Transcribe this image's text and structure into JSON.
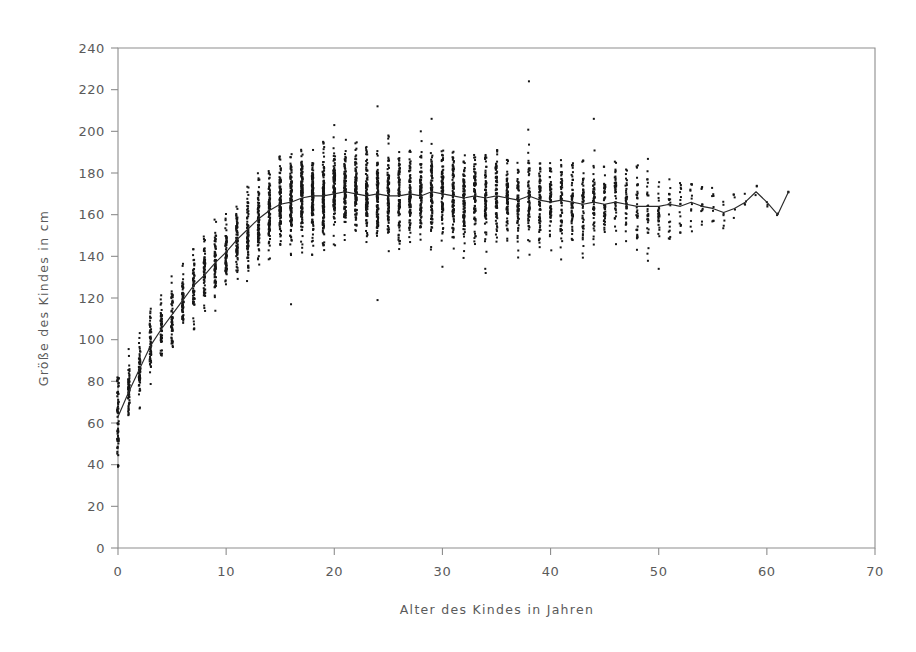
{
  "chart_data": {
    "type": "scatter",
    "title": "",
    "subtitle": "",
    "xlabel": "Alter des Kindes in Jahren",
    "ylabel": "Größe des Kindes in cm",
    "xlim": [
      0,
      70
    ],
    "ylim": [
      0,
      240
    ],
    "xticks": [
      0,
      10,
      20,
      30,
      40,
      50,
      60,
      70
    ],
    "yticks": [
      0,
      20,
      40,
      60,
      80,
      100,
      120,
      140,
      160,
      180,
      200,
      220,
      240
    ],
    "grid": false,
    "legend": null,
    "legend_position": "none",
    "point_color": "#161616",
    "line_color": "#2a2a2a",
    "axis_color": "#8d8d8d",
    "marker_size": 2,
    "series": [
      {
        "name": "Beobachtungen",
        "type": "scatter",
        "columns": [
          {
            "x": 0,
            "n": 70,
            "median": 63,
            "q_low": 52,
            "q_high": 78,
            "min": 39,
            "max": 82
          },
          {
            "x": 1,
            "n": 62,
            "median": 75,
            "q_low": 68,
            "q_high": 84,
            "min": 63,
            "max": 101
          },
          {
            "x": 2,
            "n": 60,
            "median": 86,
            "q_low": 79,
            "q_high": 95,
            "min": 67,
            "max": 104
          },
          {
            "x": 3,
            "n": 58,
            "median": 97,
            "q_low": 89,
            "q_high": 106,
            "min": 78,
            "max": 115
          },
          {
            "x": 4,
            "n": 56,
            "median": 105,
            "q_low": 97,
            "q_high": 113,
            "min": 85,
            "max": 122
          },
          {
            "x": 5,
            "n": 58,
            "median": 112,
            "q_low": 104,
            "q_high": 120,
            "min": 92,
            "max": 132
          },
          {
            "x": 6,
            "n": 60,
            "median": 119,
            "q_low": 111,
            "q_high": 128,
            "min": 99,
            "max": 141
          },
          {
            "x": 7,
            "n": 62,
            "median": 126,
            "q_low": 117,
            "q_high": 134,
            "min": 104,
            "max": 146
          },
          {
            "x": 8,
            "n": 66,
            "median": 131,
            "q_low": 122,
            "q_high": 140,
            "min": 108,
            "max": 152
          },
          {
            "x": 9,
            "n": 70,
            "median": 137,
            "q_low": 128,
            "q_high": 146,
            "min": 113,
            "max": 158
          },
          {
            "x": 10,
            "n": 74,
            "median": 142,
            "q_low": 132,
            "q_high": 152,
            "min": 117,
            "max": 164
          },
          {
            "x": 11,
            "n": 78,
            "median": 148,
            "q_low": 138,
            "q_high": 158,
            "min": 122,
            "max": 171
          },
          {
            "x": 12,
            "n": 84,
            "median": 153,
            "q_low": 142,
            "q_high": 164,
            "min": 127,
            "max": 175
          },
          {
            "x": 13,
            "n": 92,
            "median": 158,
            "q_low": 147,
            "q_high": 169,
            "min": 132,
            "max": 181
          },
          {
            "x": 14,
            "n": 100,
            "median": 162,
            "q_low": 151,
            "q_high": 173,
            "min": 134,
            "max": 186
          },
          {
            "x": 15,
            "n": 108,
            "median": 165,
            "q_low": 154,
            "q_high": 176,
            "min": 136,
            "max": 188
          },
          {
            "x": 16,
            "n": 116,
            "median": 166,
            "q_low": 155,
            "q_high": 178,
            "min": 117,
            "max": 190
          },
          {
            "x": 17,
            "n": 122,
            "median": 168,
            "q_low": 157,
            "q_high": 179,
            "min": 139,
            "max": 192
          },
          {
            "x": 18,
            "n": 126,
            "median": 169,
            "q_low": 158,
            "q_high": 180,
            "min": 140,
            "max": 193
          },
          {
            "x": 19,
            "n": 124,
            "median": 169,
            "q_low": 158,
            "q_high": 180,
            "min": 140,
            "max": 196
          },
          {
            "x": 20,
            "n": 120,
            "median": 170,
            "q_low": 159,
            "q_high": 181,
            "min": 141,
            "max": 203
          },
          {
            "x": 21,
            "n": 116,
            "median": 171,
            "q_low": 160,
            "q_high": 182,
            "min": 142,
            "max": 196
          },
          {
            "x": 22,
            "n": 112,
            "median": 170,
            "q_low": 159,
            "q_high": 181,
            "min": 141,
            "max": 195
          },
          {
            "x": 23,
            "n": 108,
            "median": 169,
            "q_low": 158,
            "q_high": 180,
            "min": 140,
            "max": 193
          },
          {
            "x": 24,
            "n": 104,
            "median": 170,
            "q_low": 159,
            "q_high": 181,
            "min": 119,
            "max": 212
          },
          {
            "x": 25,
            "n": 100,
            "median": 169,
            "q_low": 158,
            "q_high": 180,
            "min": 141,
            "max": 198
          },
          {
            "x": 26,
            "n": 98,
            "median": 169,
            "q_low": 158,
            "q_high": 180,
            "min": 140,
            "max": 193
          },
          {
            "x": 27,
            "n": 96,
            "median": 170,
            "q_low": 159,
            "q_high": 181,
            "min": 141,
            "max": 192
          },
          {
            "x": 28,
            "n": 94,
            "median": 169,
            "q_low": 158,
            "q_high": 180,
            "min": 140,
            "max": 200
          },
          {
            "x": 29,
            "n": 92,
            "median": 171,
            "q_low": 160,
            "q_high": 182,
            "min": 142,
            "max": 206
          },
          {
            "x": 30,
            "n": 90,
            "median": 170,
            "q_low": 159,
            "q_high": 181,
            "min": 135,
            "max": 194
          },
          {
            "x": 31,
            "n": 88,
            "median": 169,
            "q_low": 158,
            "q_high": 180,
            "min": 141,
            "max": 191
          },
          {
            "x": 32,
            "n": 86,
            "median": 168,
            "q_low": 157,
            "q_high": 179,
            "min": 139,
            "max": 192
          },
          {
            "x": 33,
            "n": 84,
            "median": 169,
            "q_low": 158,
            "q_high": 180,
            "min": 140,
            "max": 190
          },
          {
            "x": 34,
            "n": 80,
            "median": 168,
            "q_low": 157,
            "q_high": 179,
            "min": 132,
            "max": 189
          },
          {
            "x": 35,
            "n": 78,
            "median": 169,
            "q_low": 158,
            "q_high": 180,
            "min": 141,
            "max": 191
          },
          {
            "x": 36,
            "n": 76,
            "median": 168,
            "q_low": 157,
            "q_high": 179,
            "min": 140,
            "max": 188
          },
          {
            "x": 37,
            "n": 72,
            "median": 167,
            "q_low": 156,
            "q_high": 178,
            "min": 139,
            "max": 190
          },
          {
            "x": 38,
            "n": 70,
            "median": 169,
            "q_low": 158,
            "q_high": 180,
            "min": 140,
            "max": 224
          },
          {
            "x": 39,
            "n": 68,
            "median": 167,
            "q_low": 156,
            "q_high": 178,
            "min": 138,
            "max": 188
          },
          {
            "x": 40,
            "n": 64,
            "median": 166,
            "q_low": 155,
            "q_high": 177,
            "min": 137,
            "max": 186
          },
          {
            "x": 41,
            "n": 62,
            "median": 167,
            "q_low": 156,
            "q_high": 178,
            "min": 138,
            "max": 188
          },
          {
            "x": 42,
            "n": 58,
            "median": 166,
            "q_low": 155,
            "q_high": 177,
            "min": 136,
            "max": 185
          },
          {
            "x": 43,
            "n": 54,
            "median": 165,
            "q_low": 154,
            "q_high": 176,
            "min": 136,
            "max": 187
          },
          {
            "x": 44,
            "n": 50,
            "median": 166,
            "q_low": 155,
            "q_high": 177,
            "min": 137,
            "max": 206
          },
          {
            "x": 45,
            "n": 46,
            "median": 165,
            "q_low": 154,
            "q_high": 176,
            "min": 136,
            "max": 184
          },
          {
            "x": 46,
            "n": 42,
            "median": 166,
            "q_low": 155,
            "q_high": 177,
            "min": 137,
            "max": 186
          },
          {
            "x": 47,
            "n": 38,
            "median": 165,
            "q_low": 155,
            "q_high": 176,
            "min": 138,
            "max": 183
          },
          {
            "x": 48,
            "n": 34,
            "median": 164,
            "q_low": 154,
            "q_high": 175,
            "min": 137,
            "max": 184
          },
          {
            "x": 49,
            "n": 30,
            "median": 164,
            "q_low": 153,
            "q_high": 174,
            "min": 136,
            "max": 187
          },
          {
            "x": 50,
            "n": 26,
            "median": 164,
            "q_low": 154,
            "q_high": 174,
            "min": 134,
            "max": 181
          },
          {
            "x": 51,
            "n": 20,
            "median": 165,
            "q_low": 156,
            "q_high": 174,
            "min": 148,
            "max": 178
          },
          {
            "x": 52,
            "n": 16,
            "median": 164,
            "q_low": 156,
            "q_high": 172,
            "min": 150,
            "max": 176
          },
          {
            "x": 53,
            "n": 13,
            "median": 166,
            "q_low": 158,
            "q_high": 173,
            "min": 152,
            "max": 176
          },
          {
            "x": 54,
            "n": 11,
            "median": 164,
            "q_low": 157,
            "q_high": 171,
            "min": 153,
            "max": 174
          },
          {
            "x": 55,
            "n": 9,
            "median": 163,
            "q_low": 157,
            "q_high": 170,
            "min": 154,
            "max": 173
          },
          {
            "x": 56,
            "n": 7,
            "median": 161,
            "q_low": 156,
            "q_high": 168,
            "min": 153,
            "max": 171
          },
          {
            "x": 57,
            "n": 5,
            "median": 163,
            "q_low": 158,
            "q_high": 168,
            "min": 156,
            "max": 170
          },
          {
            "x": 58,
            "n": 4,
            "median": 166,
            "q_low": 161,
            "q_high": 170,
            "min": 159,
            "max": 172
          },
          {
            "x": 59,
            "n": 3,
            "median": 171,
            "q_low": 168,
            "q_high": 173,
            "min": 166,
            "max": 174
          },
          {
            "x": 60,
            "n": 3,
            "median": 166,
            "q_low": 163,
            "q_high": 169,
            "min": 161,
            "max": 171
          },
          {
            "x": 61,
            "n": 2,
            "median": 160,
            "q_low": 158,
            "q_high": 163,
            "min": 157,
            "max": 164
          },
          {
            "x": 62,
            "n": 2,
            "median": 171,
            "q_low": 169,
            "q_high": 173,
            "min": 167,
            "max": 174
          }
        ],
        "outliers": [
          {
            "x": 38,
            "y": 224
          },
          {
            "x": 24,
            "y": 212
          },
          {
            "x": 44,
            "y": 206
          },
          {
            "x": 29,
            "y": 206
          },
          {
            "x": 20,
            "y": 203
          },
          {
            "x": 28,
            "y": 200
          },
          {
            "x": 25,
            "y": 198
          },
          {
            "x": 16,
            "y": 117
          },
          {
            "x": 24,
            "y": 119
          },
          {
            "x": 34,
            "y": 132
          },
          {
            "x": 50,
            "y": 134
          },
          {
            "x": 30,
            "y": 135
          },
          {
            "x": 2,
            "y": 67
          },
          {
            "x": 0,
            "y": 39
          }
        ]
      },
      {
        "name": "Mittlere Größe (Trendlinie)",
        "type": "line",
        "x": [
          0,
          1,
          2,
          3,
          4,
          5,
          6,
          7,
          8,
          9,
          10,
          11,
          12,
          13,
          14,
          15,
          16,
          17,
          18,
          19,
          20,
          21,
          22,
          23,
          24,
          25,
          26,
          27,
          28,
          29,
          30,
          31,
          32,
          33,
          34,
          35,
          36,
          37,
          38,
          39,
          40,
          41,
          42,
          43,
          44,
          45,
          46,
          47,
          48,
          49,
          50,
          51,
          52,
          53,
          54,
          55,
          56,
          57,
          58,
          59,
          60,
          61,
          62
        ],
        "y": [
          63,
          75,
          86,
          97,
          105,
          112,
          119,
          126,
          131,
          137,
          142,
          148,
          153,
          158,
          162,
          165,
          166,
          168,
          169,
          169,
          170,
          171,
          170,
          169,
          170,
          169,
          169,
          170,
          169,
          171,
          170,
          169,
          168,
          169,
          168,
          169,
          168,
          167,
          169,
          167,
          166,
          167,
          166,
          165,
          166,
          165,
          166,
          165,
          164,
          164,
          164,
          165,
          164,
          166,
          164,
          163,
          161,
          163,
          166,
          171,
          166,
          160,
          171
        ]
      }
    ]
  },
  "axes": {
    "x_title": "Alter des Kindes in Jahren",
    "y_title": "Größe des Kindes in cm",
    "x_tick_labels": [
      "0",
      "10",
      "20",
      "30",
      "40",
      "50",
      "60",
      "70"
    ],
    "y_tick_labels": [
      "0",
      "20",
      "40",
      "60",
      "80",
      "100",
      "120",
      "140",
      "160",
      "180",
      "200",
      "220",
      "240"
    ]
  }
}
